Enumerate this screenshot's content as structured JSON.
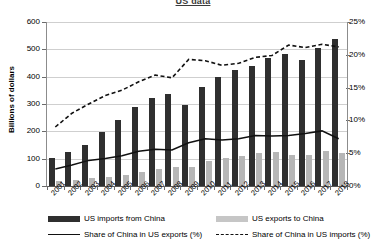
{
  "chart_data": {
    "type": "bar",
    "title": "US data",
    "xlabel": "",
    "ylabel": "Billions of dollars",
    "y2label": "",
    "categories": [
      "2001",
      "2002",
      "2003",
      "2004",
      "2005",
      "2006",
      "2007",
      "2008",
      "2009",
      "2010",
      "2011",
      "2012",
      "2013",
      "2014",
      "2015",
      "2016",
      "2017",
      "2018"
    ],
    "ylim": [
      0,
      600
    ],
    "y2lim": [
      0,
      25
    ],
    "yticks": [
      "0",
      "100",
      "200",
      "300",
      "400",
      "500",
      "600"
    ],
    "y2ticks": [
      "0%",
      "5%",
      "10%",
      "15%",
      "20%",
      "25%"
    ],
    "grid": true,
    "legend_position": "bottom",
    "series": [
      {
        "name": "US imports from China",
        "axis": "left",
        "kind": "bar",
        "color": "#2f2f2f",
        "values": [
          102,
          125,
          152,
          196,
          243,
          288,
          321,
          337,
          296,
          364,
          399,
          425,
          440,
          468,
          483,
          462,
          505,
          539
        ]
      },
      {
        "name": "US exports to China",
        "axis": "left",
        "kind": "bar",
        "color": "#b6b6b6",
        "values": [
          19,
          22,
          28,
          34,
          41,
          53,
          62,
          69,
          69,
          91,
          103,
          110,
          121,
          123,
          115,
          115,
          129,
          120
        ]
      },
      {
        "name": "Share of China in US exports (%)",
        "axis": "right",
        "kind": "line-solid",
        "color": "#111111",
        "values": [
          2.6,
          3.2,
          3.9,
          4.2,
          4.6,
          5.3,
          5.6,
          5.5,
          6.6,
          7.2,
          7.0,
          7.2,
          7.7,
          7.6,
          7.7,
          8.0,
          8.4,
          7.2
        ]
      },
      {
        "name": "Share of China in US imports (%)",
        "axis": "right",
        "kind": "line-dashed",
        "color": "#111111",
        "values": [
          9.0,
          11.1,
          12.5,
          13.8,
          14.6,
          15.9,
          16.9,
          16.5,
          19.3,
          19.1,
          18.4,
          18.7,
          19.6,
          19.9,
          21.5,
          21.1,
          21.6,
          21.2
        ]
      }
    ]
  }
}
